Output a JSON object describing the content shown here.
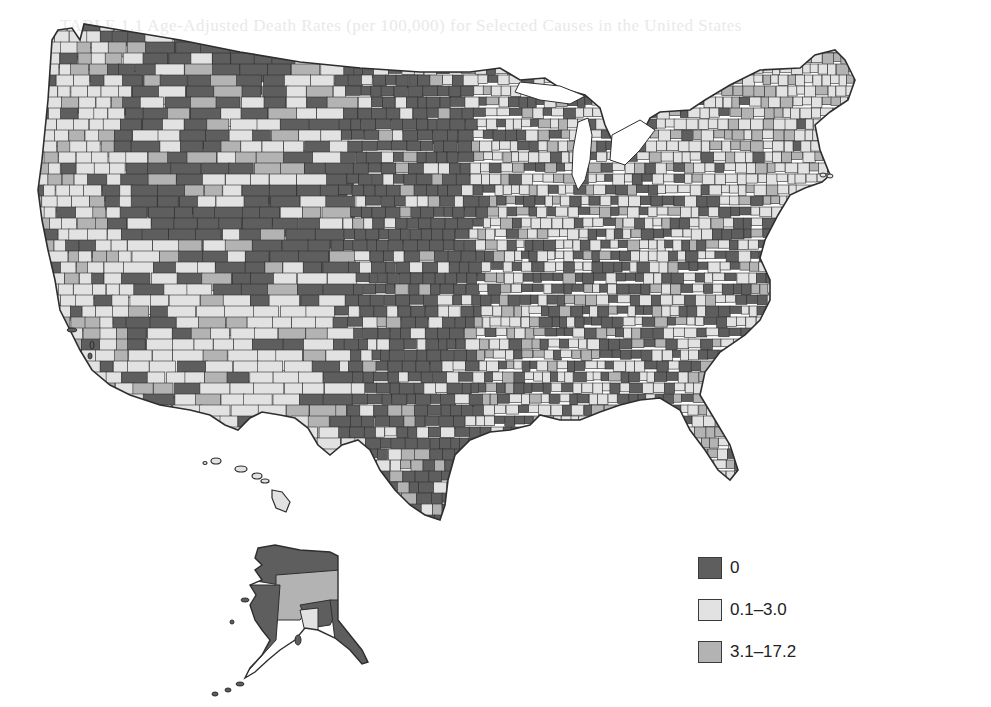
{
  "figure": {
    "type": "choropleth",
    "colors": {
      "zero": "#5e5e5e",
      "low": "#e2e2e2",
      "high": "#b3b3b3",
      "border": "#2e2e2e",
      "background": "#ffffff",
      "water": "#ffffff"
    }
  },
  "legend": {
    "items": [
      {
        "label": "0",
        "class": "zero",
        "color": "#5e5e5e"
      },
      {
        "label": "0.1–3.0",
        "class": "low",
        "color": "#e2e2e2"
      },
      {
        "label": "3.1–17.2",
        "class": "high",
        "color": "#b3b3b3"
      }
    ]
  },
  "regions": [
    {
      "name": "pacific-coast",
      "dominant": "low",
      "mix": {
        "zero": 0.15,
        "low": 0.65,
        "high": 0.2
      }
    },
    {
      "name": "mountain-west",
      "dominant": "zero",
      "mix": {
        "zero": 0.55,
        "low": 0.3,
        "high": 0.15
      }
    },
    {
      "name": "southwest",
      "dominant": "low",
      "mix": {
        "zero": 0.2,
        "low": 0.65,
        "high": 0.15
      }
    },
    {
      "name": "great-plains",
      "dominant": "zero",
      "mix": {
        "zero": 0.8,
        "low": 0.15,
        "high": 0.05
      }
    },
    {
      "name": "texas",
      "dominant": "zero",
      "mix": {
        "zero": 0.7,
        "low": 0.22,
        "high": 0.08
      }
    },
    {
      "name": "midwest-east",
      "dominant": "low",
      "mix": {
        "zero": 0.35,
        "low": 0.5,
        "high": 0.15
      }
    },
    {
      "name": "northeast",
      "dominant": "low",
      "mix": {
        "zero": 0.1,
        "low": 0.65,
        "high": 0.25
      }
    },
    {
      "name": "southeast",
      "dominant": "mixed",
      "mix": {
        "zero": 0.5,
        "low": 0.35,
        "high": 0.15
      }
    },
    {
      "name": "florida",
      "dominant": "low",
      "mix": {
        "zero": 0.15,
        "low": 0.55,
        "high": 0.3
      }
    },
    {
      "name": "alaska",
      "dominant": "zero",
      "mix": {
        "zero": 0.6,
        "low": 0.15,
        "high": 0.25
      }
    },
    {
      "name": "hawaii",
      "dominant": "low",
      "mix": {
        "zero": 0.0,
        "low": 1.0,
        "high": 0.0
      }
    }
  ],
  "bleed_text": "TABLE 1.1   Age-Adjusted Death Rates (per 100,000) for Selected Causes in the United States"
}
